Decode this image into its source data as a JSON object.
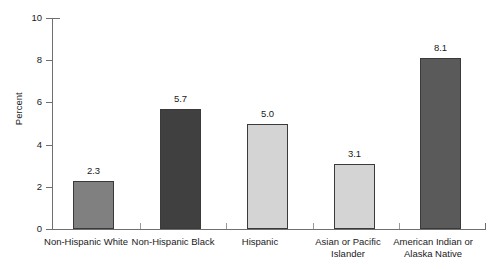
{
  "chart_data": {
    "type": "bar",
    "title": "",
    "subtitle": "",
    "xlabel": "",
    "ylabel": "Percent",
    "ylim": [
      0,
      10
    ],
    "yticks": [
      0,
      2,
      4,
      6,
      8,
      10
    ],
    "ytick_labels": [
      "0",
      "2",
      "4",
      "6",
      "8",
      "10"
    ],
    "grid": false,
    "legend": "none",
    "categories": [
      "Non-Hispanic White",
      "Non-Hispanic Black",
      "Hispanic",
      "Asian or Pacific Islander",
      "American Indian or Alaska Native"
    ],
    "category_lines": [
      [
        "Non-Hispanic White"
      ],
      [
        "Non-Hispanic Black"
      ],
      [
        "Hispanic"
      ],
      [
        "Asian or Pacific",
        "Islander"
      ],
      [
        "American Indian or",
        "Alaska Native"
      ]
    ],
    "values": [
      2.3,
      5.7,
      5.0,
      3.1,
      8.1
    ],
    "value_labels": [
      "2.3",
      "5.7",
      "5.0",
      "3.1",
      "8.1"
    ],
    "bar_colors": [
      "#808080",
      "#404040",
      "#d4d4d4",
      "#d4d4d4",
      "#5a5a5a"
    ],
    "bar_edge_color": "#3a3a3a",
    "axis_color": "#6f6f6f",
    "text_color": "#1a1a1a",
    "background": "#ffffff"
  }
}
